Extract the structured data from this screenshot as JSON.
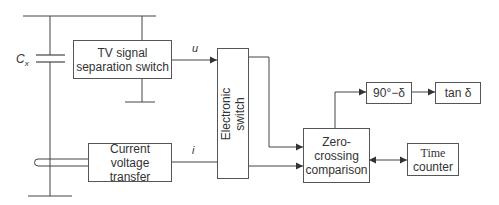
{
  "diagram": {
    "type": "block-diagram",
    "title": "",
    "components": {
      "capacitor": {
        "label": "C",
        "subscript": "x"
      },
      "tv_switch": {
        "line1": "TV signal",
        "line2": "separation switch"
      },
      "current_transfer": {
        "line1": "Current",
        "line2": "voltage transfer"
      },
      "electronic_switch": {
        "line1": "Electronic",
        "line2": "switch"
      },
      "zero_crossing": {
        "line1": "Zero-crossing",
        "line2": "comparison"
      },
      "phase": {
        "label": "90°−δ"
      },
      "tan": {
        "label": "tan δ"
      },
      "time_counter": {
        "line1": "Time",
        "line2": "counter"
      }
    },
    "signals": {
      "u": "u",
      "i": "i"
    },
    "connections": [
      {
        "from": "tv_switch",
        "to": "electronic_switch",
        "label": "u"
      },
      {
        "from": "current_transfer",
        "to": "electronic_switch",
        "label": "i"
      },
      {
        "from": "electronic_switch",
        "to": "zero_crossing"
      },
      {
        "from": "electronic_switch",
        "to": "zero_crossing"
      },
      {
        "from": "zero_crossing",
        "to": "phase"
      },
      {
        "from": "phase",
        "to": "tan"
      },
      {
        "from": "zero_crossing",
        "to": "time_counter",
        "bidirectional": true
      }
    ],
    "colors": {
      "line": "#444444",
      "text": "#333333",
      "background": "#ffffff"
    }
  }
}
